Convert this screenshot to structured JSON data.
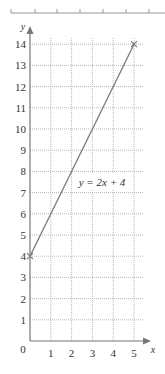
{
  "chart_data": {
    "type": "line",
    "title": "",
    "xlabel": "x",
    "ylabel": "y",
    "origin_label": "0",
    "xlim": [
      0,
      5.5
    ],
    "ylim": [
      0,
      14.5
    ],
    "x_ticks": [
      "1",
      "2",
      "3",
      "4",
      "5"
    ],
    "y_ticks": [
      "1",
      "2",
      "3",
      "4",
      "5",
      "6",
      "7",
      "8",
      "9",
      "10",
      "11",
      "12",
      "13",
      "14"
    ],
    "grid": true,
    "grid_style": "dotted",
    "series": [
      {
        "name": "y = 2x + 4",
        "equation": "y = 2x + 4",
        "x": [
          0,
          5
        ],
        "y": [
          4,
          14
        ],
        "markers": "cross",
        "color": "#777777"
      }
    ],
    "annotations": [
      {
        "text": "y = 2x + 4",
        "x": 3.2,
        "y": 7.5
      }
    ]
  },
  "colors": {
    "axis": "#777777",
    "grid": "#b8b8b8",
    "line": "#7a7a7a",
    "text": "#333333"
  }
}
